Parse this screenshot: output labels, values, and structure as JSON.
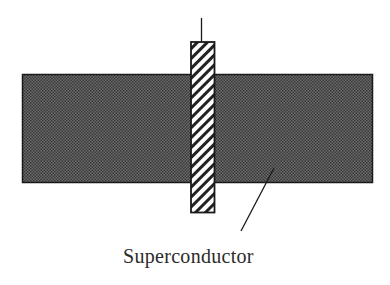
{
  "diagram": {
    "label": "Superconductor",
    "colors": {
      "superconductor_fill": "#555555",
      "outline": "#1a1a1a",
      "rod_hatch": "#222222",
      "rod_background": "#ffffff"
    },
    "components": [
      {
        "name": "superconductor-slab",
        "shape": "rectangle",
        "fill": "dotted-dark"
      },
      {
        "name": "rod",
        "shape": "rectangle",
        "fill": "diagonal-hatch"
      },
      {
        "name": "lead-wire",
        "shape": "line"
      },
      {
        "name": "leader-line",
        "shape": "line",
        "points_to": "superconductor-slab"
      }
    ]
  }
}
